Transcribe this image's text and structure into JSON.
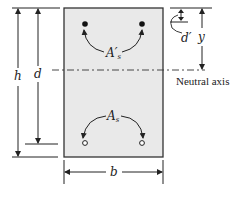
{
  "figure": {
    "labels": {
      "h": "h",
      "d": "d",
      "b": "b",
      "d_prime": "d′",
      "y": "y",
      "As_prime": "A′s",
      "As": "As",
      "neutral_axis": "Neutral axis"
    },
    "colors": {
      "section_fill": "#e9e9e9",
      "line": "#222222"
    }
  }
}
